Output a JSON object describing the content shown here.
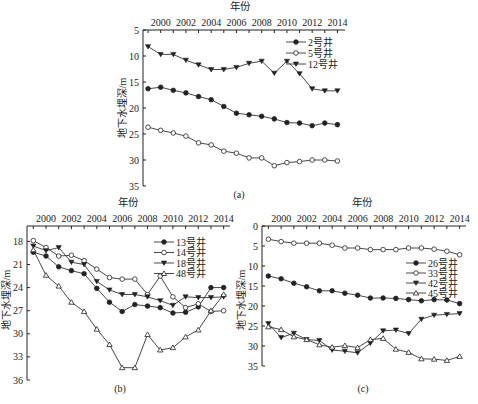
{
  "chart_data": [
    {
      "id": "a",
      "type": "line",
      "caption": "(a)",
      "title": "",
      "xlabel": "年份",
      "ylabel": "地下水埋深/m",
      "x": [
        1999,
        2000,
        2001,
        2002,
        2003,
        2004,
        2005,
        2006,
        2007,
        2008,
        2009,
        2010,
        2011,
        2012,
        2013,
        2014
      ],
      "xticks": [
        "2000",
        "2002",
        "2004",
        "2006",
        "2008",
        "2010",
        "2012",
        "2014"
      ],
      "yticks": [
        "5",
        "10",
        "15",
        "20",
        "25",
        "30",
        "35"
      ],
      "ylim": [
        5,
        35
      ],
      "y_inverted": true,
      "x_axis_position": "top",
      "legend_position": "upper right",
      "series": [
        {
          "name": "2号井",
          "marker": "filled-circle",
          "values": [
            16.3,
            16.0,
            16.6,
            17.1,
            17.8,
            18.4,
            19.7,
            21.0,
            21.3,
            21.6,
            22.1,
            22.8,
            22.9,
            23.4,
            22.9,
            23.2
          ]
        },
        {
          "name": "5号井",
          "marker": "open-circle",
          "values": [
            23.7,
            24.3,
            24.8,
            25.4,
            26.7,
            27.1,
            28.3,
            28.7,
            29.6,
            29.6,
            31.1,
            30.5,
            30.3,
            30.0,
            30.0,
            30.2
          ]
        },
        {
          "name": "12号井",
          "marker": "filled-triangle-down",
          "values": [
            8.2,
            9.7,
            9.7,
            10.8,
            11.7,
            12.6,
            12.6,
            12.2,
            11.4,
            11.0,
            13.3,
            11.0,
            13.4,
            16.3,
            16.7,
            16.7
          ]
        }
      ]
    },
    {
      "id": "b",
      "type": "line",
      "caption": "(b)",
      "title": "",
      "xlabel": "年份",
      "ylabel": "地下水埋深/m",
      "x": [
        1999,
        2000,
        2001,
        2002,
        2003,
        2004,
        2005,
        2006,
        2007,
        2008,
        2009,
        2010,
        2011,
        2012,
        2013,
        2014
      ],
      "xticks": [
        "2000",
        "2002",
        "2004",
        "2006",
        "2008",
        "2010",
        "2012",
        "2014"
      ],
      "yticks": [
        "18",
        "21",
        "24",
        "27",
        "30",
        "33",
        "36"
      ],
      "ylim": [
        16,
        36
      ],
      "y_inverted": true,
      "x_axis_position": "top",
      "legend_position": "upper right",
      "series": [
        {
          "name": "13号井",
          "marker": "filled-circle",
          "values": [
            19.4,
            19.9,
            21.3,
            21.8,
            22.2,
            24.1,
            25.9,
            27.1,
            26.2,
            26.4,
            26.6,
            27.3,
            27.2,
            26.5,
            24.0,
            24.0
          ]
        },
        {
          "name": "14号井",
          "marker": "open-circle",
          "values": [
            17.9,
            18.8,
            19.9,
            19.8,
            20.5,
            21.6,
            22.7,
            22.9,
            22.9,
            24.9,
            22.5,
            25.2,
            26.6,
            26.1,
            27.1,
            27.0
          ]
        },
        {
          "name": "18号井",
          "marker": "filled-triangle-down",
          "values": [
            18.6,
            19.2,
            18.8,
            20.7,
            21.0,
            23.2,
            24.3,
            24.9,
            24.9,
            25.2,
            25.7,
            26.3,
            25.2,
            25.3,
            25.3,
            25.2
          ]
        },
        {
          "name": "48号井",
          "marker": "open-triangle-up",
          "values": [
            19.1,
            22.4,
            23.8,
            25.9,
            27.1,
            29.4,
            31.4,
            34.4,
            34.4,
            30.1,
            32.1,
            31.8,
            30.4,
            29.5,
            27.0,
            24.9
          ]
        }
      ]
    },
    {
      "id": "c",
      "type": "line",
      "caption": "(c)",
      "title": "",
      "xlabel": "年份",
      "ylabel": "地下水埋深/m",
      "x": [
        1999,
        2000,
        2001,
        2002,
        2003,
        2004,
        2005,
        2006,
        2007,
        2008,
        2009,
        2010,
        2011,
        2012,
        2013,
        2014
      ],
      "xticks": [
        "2000",
        "2002",
        "2004",
        "2006",
        "2008",
        "2010",
        "2012",
        "2014"
      ],
      "yticks": [
        "0",
        "5",
        "10",
        "15",
        "20",
        "25",
        "30",
        "35"
      ],
      "ylim": [
        0,
        35
      ],
      "y_inverted": true,
      "x_axis_position": "top",
      "legend_position": "right",
      "series": [
        {
          "name": "26号井",
          "marker": "filled-circle",
          "values": [
            12.5,
            13.2,
            14.3,
            15.2,
            16.2,
            16.2,
            16.8,
            17.3,
            18.0,
            18.0,
            18.1,
            18.4,
            18.7,
            18.4,
            18.5,
            19.4
          ]
        },
        {
          "name": "33号井",
          "marker": "open-circle",
          "values": [
            3.3,
            3.9,
            4.3,
            4.3,
            4.3,
            4.8,
            5.5,
            5.5,
            5.9,
            5.9,
            5.9,
            5.5,
            5.5,
            5.8,
            6.3,
            7.2
          ]
        },
        {
          "name": "42号井",
          "marker": "filled-triangle-down",
          "values": [
            24.4,
            27.9,
            26.8,
            28.4,
            28.6,
            31.0,
            31.3,
            31.7,
            29.3,
            26.2,
            26.0,
            26.9,
            23.3,
            22.3,
            22.1,
            21.9
          ]
        },
        {
          "name": "45号井",
          "marker": "open-triangle-up",
          "values": [
            25.2,
            25.9,
            27.7,
            28.4,
            29.7,
            30.3,
            29.9,
            30.4,
            28.4,
            28.1,
            30.8,
            31.6,
            33.2,
            33.3,
            33.6,
            32.6
          ]
        }
      ]
    }
  ],
  "layout": {
    "panels": [
      {
        "id": "a",
        "plot": {
          "x0": 143,
          "x1": 345,
          "y0": 30,
          "y1": 186
        },
        "ymin": 5,
        "ymax": 35,
        "xmin": 1998.6,
        "xmax": 2014.6,
        "caption_xy": [
          239,
          198
        ],
        "xlabel_xy": [
          240,
          10
        ],
        "ylabel_xy": [
          126,
          108
        ],
        "legend": {
          "x": 300,
          "y": 42,
          "dy": 11
        }
      },
      {
        "id": "b",
        "plot": {
          "x0": 27,
          "x1": 230,
          "y0": 226,
          "y1": 380
        },
        "ymin": 16,
        "ymax": 36,
        "xmin": 1998.5,
        "xmax": 2014.5,
        "caption_xy": [
          120,
          392
        ],
        "xlabel_xy": [
          128,
          206
        ],
        "ylabel_xy": [
          10,
          300
        ],
        "legend": {
          "x": 168,
          "y": 242,
          "dy": 10.5
        }
      },
      {
        "id": "c",
        "plot": {
          "x0": 262,
          "x1": 466,
          "y0": 226,
          "y1": 366
        },
        "ymin": 0,
        "ymax": 35,
        "xmin": 1998.5,
        "xmax": 2014.5,
        "caption_xy": [
          363,
          392
        ],
        "xlabel_xy": [
          362,
          206
        ],
        "ylabel_xy": [
          245,
          300
        ],
        "legend": {
          "x": 420,
          "y": 263,
          "dy": 10
        }
      }
    ]
  }
}
